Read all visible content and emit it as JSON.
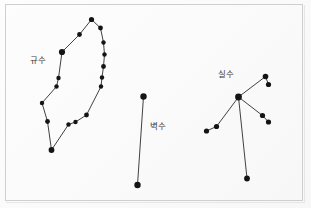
{
  "figure": {
    "background_color": "#fefefe",
    "border_color": "#cfcfcf",
    "star_color": "#141414",
    "line_color": "#2b2b2b",
    "label_color": "#3a3a3a",
    "width": 311,
    "height": 208
  },
  "chart_data": {
    "type": "scatter",
    "title": "",
    "xlabel": "",
    "ylabel": "",
    "grid": false,
    "legend_position": "none",
    "xlim": [
      0,
      311
    ],
    "ylim": [
      0,
      208
    ],
    "constellations": [
      {
        "name": "규수",
        "label_x": 30,
        "label_y": 56,
        "shape": "closed-loop",
        "star_count": 16,
        "stars": [
          {
            "id": "k1",
            "x": 91.5,
            "y": 19.5,
            "r": 2.6
          },
          {
            "id": "k2",
            "x": 100.5,
            "y": 28.0,
            "r": 2.4
          },
          {
            "id": "k3",
            "x": 103.5,
            "y": 42.5,
            "r": 2.2
          },
          {
            "id": "k4",
            "x": 104.5,
            "y": 54.5,
            "r": 2.2
          },
          {
            "id": "k5",
            "x": 103.5,
            "y": 66.5,
            "r": 2.4
          },
          {
            "id": "k6",
            "x": 102.0,
            "y": 77.5,
            "r": 2.2
          },
          {
            "id": "k7",
            "x": 101.0,
            "y": 86.5,
            "r": 2.2
          },
          {
            "id": "k8",
            "x": 86.5,
            "y": 115.0,
            "r": 2.4
          },
          {
            "id": "k9",
            "x": 75.5,
            "y": 122.0,
            "r": 2.2
          },
          {
            "id": "k10",
            "x": 68.5,
            "y": 124.5,
            "r": 2.2
          },
          {
            "id": "k11",
            "x": 51.5,
            "y": 150.0,
            "r": 2.9
          },
          {
            "id": "k12",
            "x": 47.5,
            "y": 121.5,
            "r": 2.4
          },
          {
            "id": "k13",
            "x": 42.0,
            "y": 103.0,
            "r": 2.2
          },
          {
            "id": "k14",
            "x": 56.5,
            "y": 86.5,
            "r": 2.2
          },
          {
            "id": "k15",
            "x": 58.5,
            "y": 78.0,
            "r": 2.2
          },
          {
            "id": "k16",
            "x": 62.0,
            "y": 52.0,
            "r": 3.1
          },
          {
            "id": "k17",
            "x": 79.5,
            "y": 34.5,
            "r": 2.4
          }
        ],
        "edges": [
          [
            "k1",
            "k2"
          ],
          [
            "k2",
            "k3"
          ],
          [
            "k3",
            "k4"
          ],
          [
            "k4",
            "k5"
          ],
          [
            "k5",
            "k6"
          ],
          [
            "k6",
            "k7"
          ],
          [
            "k7",
            "k8"
          ],
          [
            "k8",
            "k9"
          ],
          [
            "k9",
            "k10"
          ],
          [
            "k10",
            "k11"
          ],
          [
            "k11",
            "k12"
          ],
          [
            "k12",
            "k13"
          ],
          [
            "k13",
            "k14"
          ],
          [
            "k14",
            "k15"
          ],
          [
            "k15",
            "k16"
          ],
          [
            "k16",
            "k17"
          ],
          [
            "k17",
            "k1"
          ]
        ]
      },
      {
        "name": "벽수",
        "label_x": 150,
        "label_y": 122,
        "shape": "line",
        "star_count": 2,
        "stars": [
          {
            "id": "b1",
            "x": 143.5,
            "y": 96.5,
            "r": 3.2
          },
          {
            "id": "b2",
            "x": 137.5,
            "y": 185.0,
            "r": 3.2
          }
        ],
        "edges": [
          [
            "b1",
            "b2"
          ]
        ]
      },
      {
        "name": "실수",
        "label_x": 218,
        "label_y": 70,
        "shape": "hub-and-spokes",
        "star_count": 8,
        "stars": [
          {
            "id": "s_hub",
            "x": 238.5,
            "y": 97.0,
            "r": 3.4
          },
          {
            "id": "s_ur1",
            "x": 265.5,
            "y": 76.5,
            "r": 2.8
          },
          {
            "id": "s_ur2",
            "x": 268.5,
            "y": 84.5,
            "r": 2.6
          },
          {
            "id": "s_r1",
            "x": 262.5,
            "y": 115.5,
            "r": 2.6
          },
          {
            "id": "s_r2",
            "x": 268.5,
            "y": 122.0,
            "r": 2.6
          },
          {
            "id": "s_ll1",
            "x": 216.5,
            "y": 126.5,
            "r": 2.6
          },
          {
            "id": "s_ll2",
            "x": 206.5,
            "y": 131.0,
            "r": 2.6
          },
          {
            "id": "s_bot",
            "x": 247.0,
            "y": 178.5,
            "r": 2.9
          }
        ],
        "edges": [
          [
            "s_hub",
            "s_ur1"
          ],
          [
            "s_ur1",
            "s_ur2"
          ],
          [
            "s_hub",
            "s_r1"
          ],
          [
            "s_r1",
            "s_r2"
          ],
          [
            "s_hub",
            "s_ll1"
          ],
          [
            "s_ll1",
            "s_ll2"
          ],
          [
            "s_hub",
            "s_bot"
          ]
        ]
      }
    ]
  }
}
